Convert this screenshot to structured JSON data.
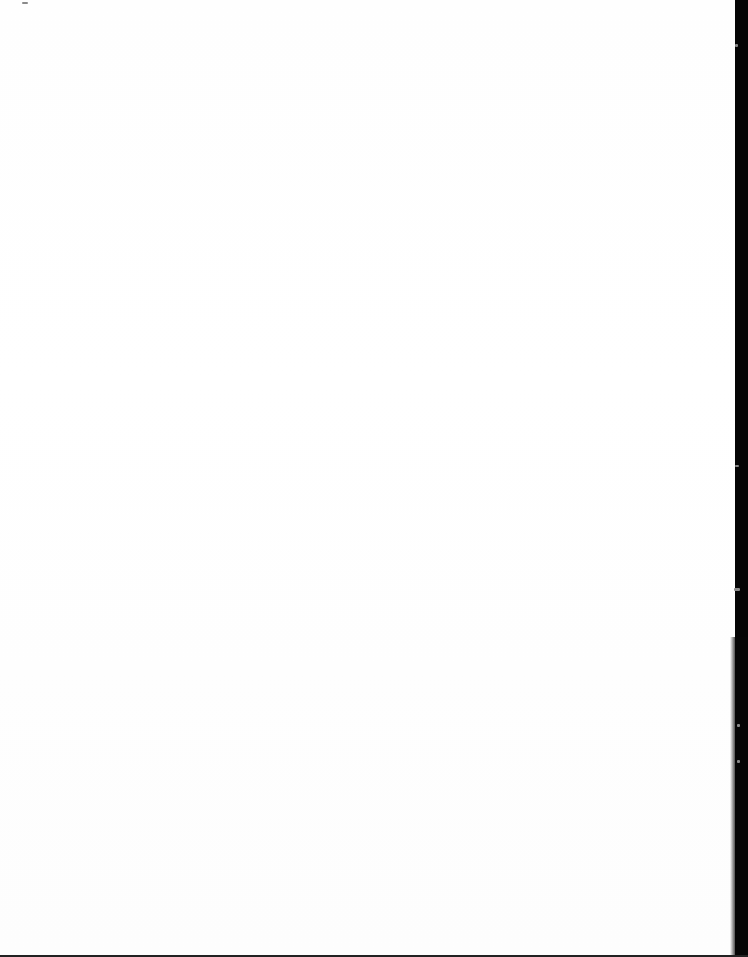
{
  "document": {
    "page_type": "blank scanned page"
  },
  "colors": {
    "paper": "#ffffff",
    "scan_edge": "#050505"
  }
}
